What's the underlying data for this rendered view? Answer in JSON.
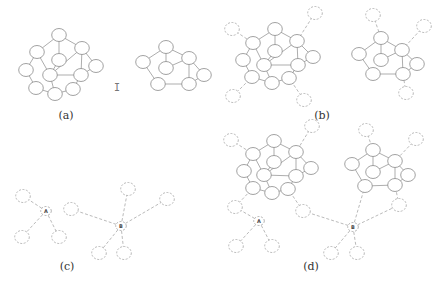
{
  "figure": {
    "panels": [
      {
        "id": "a",
        "label": "(a)"
      },
      {
        "id": "b",
        "label": "(b)"
      },
      {
        "id": "c",
        "label": "(c)"
      },
      {
        "id": "d",
        "label": "(d)"
      }
    ],
    "hub_labels": {
      "A": "A",
      "B": "B"
    },
    "cursor_glyph": "I"
  },
  "graphs": {
    "graph1": {
      "nodes": [
        "n1",
        "n2",
        "n3",
        "n4",
        "n5",
        "n6",
        "n7",
        "n8",
        "n9",
        "n10",
        "n11"
      ],
      "edges": [
        [
          "n1",
          "n2"
        ],
        [
          "n1",
          "n3"
        ],
        [
          "n1",
          "n4"
        ],
        [
          "n2",
          "n6"
        ],
        [
          "n2",
          "n7"
        ],
        [
          "n4",
          "n5"
        ],
        [
          "n4",
          "n8"
        ],
        [
          "n3",
          "n7"
        ],
        [
          "n4",
          "n7"
        ],
        [
          "n6",
          "n9"
        ],
        [
          "n7",
          "n8"
        ],
        [
          "n7",
          "n10"
        ],
        [
          "n9",
          "n10"
        ],
        [
          "n10",
          "n11"
        ],
        [
          "n8",
          "n11"
        ],
        [
          "n5",
          "n8"
        ]
      ]
    },
    "graph2": {
      "nodes": [
        "m1",
        "m2",
        "m3",
        "m4",
        "m5",
        "m6",
        "m7"
      ],
      "edges": [
        [
          "m1",
          "m2"
        ],
        [
          "m1",
          "m3"
        ],
        [
          "m1",
          "m4"
        ],
        [
          "m2",
          "m6"
        ],
        [
          "m3",
          "m4"
        ],
        [
          "m4",
          "m5"
        ],
        [
          "m4",
          "m7"
        ],
        [
          "m6",
          "m7"
        ],
        [
          "m5",
          "m7"
        ]
      ]
    },
    "star_A": {
      "hub": "A",
      "leaves": 3
    },
    "star_B": {
      "hub": "B",
      "leaves": 5
    }
  }
}
